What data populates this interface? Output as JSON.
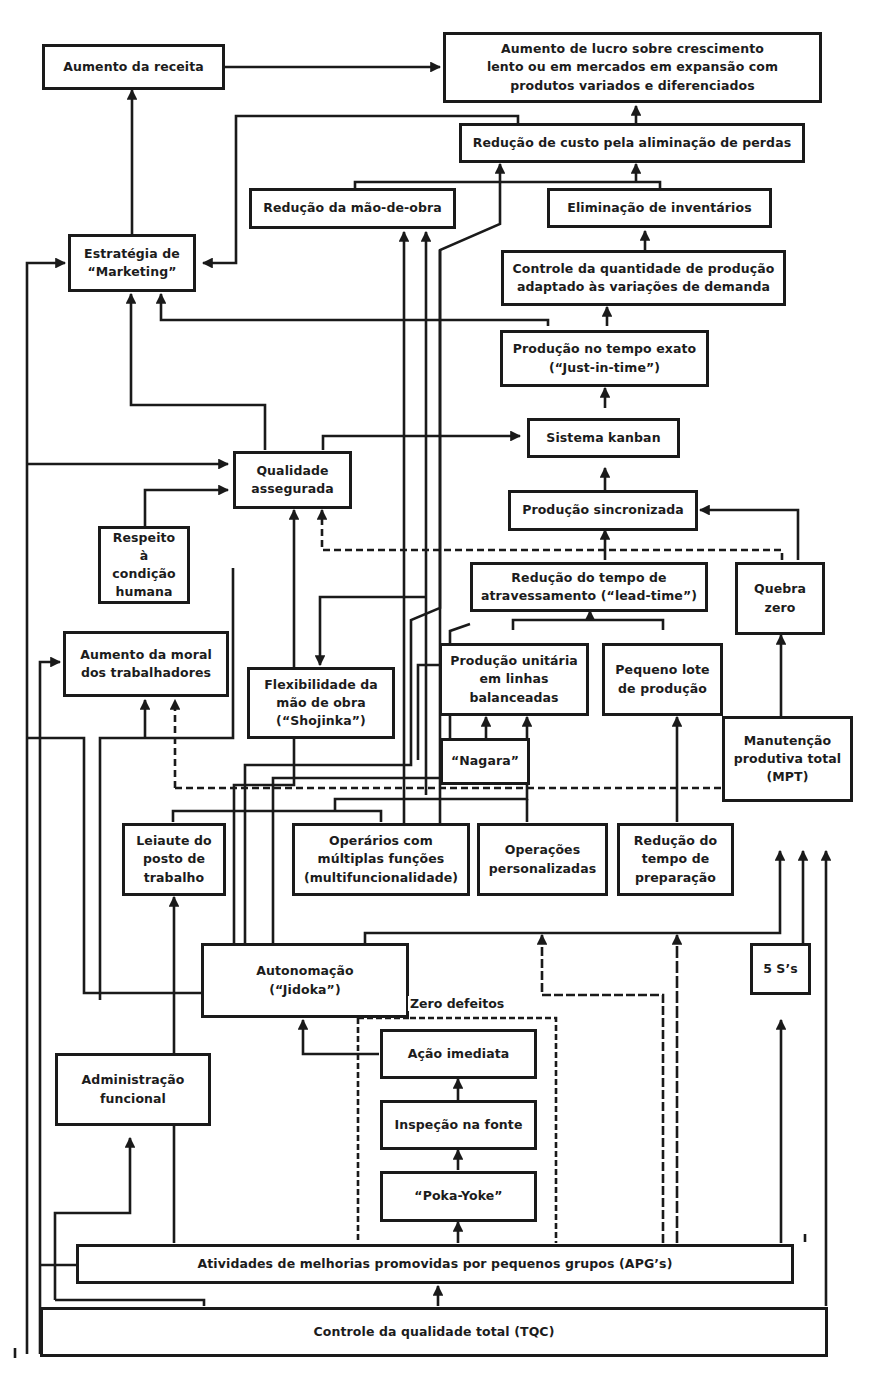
{
  "diagram": {
    "nodes": {
      "aumento_receita": "Aumento da receita",
      "aumento_lucro": "Aumento de lucro sobre crescimento\nlento ou em mercados em expansão com\nprodutos variados e diferenciados",
      "reducao_custo": "Redução de custo pela aliminação de perdas",
      "reducao_mao_obra": "Redução da mão-de-obra",
      "eliminacao_inventarios": "Eliminação de inventários",
      "estrategia_marketing": "Estratégia de\n“Marketing”",
      "controle_quantidade": "Controle da quantidade de produção\nadaptado às variações de demanda",
      "producao_tempo_exato": "Produção no tempo exato\n(“Just-in-time”)",
      "sistema_kanban": "Sistema kanban",
      "qualidade_assegurada": "Qualidade\nassegurada",
      "producao_sincronizada": "Produção sincronizada",
      "respeito_condicao_humana": "Respeito à\ncondição\nhumana",
      "reducao_lead_time": "Redução do tempo de\natravessamento (“lead-time”)",
      "quebra_zero": "Quebra\nzero",
      "aumento_moral": "Aumento da moral\ndos trabalhadores",
      "flexibilidade_mao_obra": "Flexibilidade da\nmão de obra\n(“Shojinka”)",
      "producao_unitaria": "Produção unitária\nem linhas\nbalanceadas",
      "pequeno_lote": "Pequeno lote\nde produção",
      "nagara": "“Nagara”",
      "mpt": "Manutenção\nprodutiva total\n(MPT)",
      "leiaute_posto": "Leiaute do\nposto de\ntrabalho",
      "operarios_multiplas_funcoes": "Operários com\nmúltiplas funções\n(multifuncionalidade)",
      "operacoes_personalizadas": "Operações\npersonalizadas",
      "reducao_tempo_preparacao": "Redução do\ntempo de\npreparação",
      "autonomacao": "Autonomação\n(“Jidoka”)",
      "cinco_s": "5 S’s",
      "acao_imediata": "Ação imediata",
      "administracao_funcional": "Administração\nfuncional",
      "inspecao_fonte": "Inspeção na fonte",
      "poka_yoke": "“Poka-Yoke”",
      "apgs": "Atividades de melhorias promovidas por pequenos grupos (APG’s)",
      "tqc": "Controle da qualidade total (TQC)"
    },
    "groups": {
      "zero_defeitos": "Zero defeitos"
    },
    "colors": {
      "line": "#1a1a1a",
      "background": "#ffffff"
    }
  }
}
